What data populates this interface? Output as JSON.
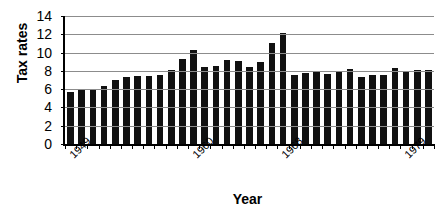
{
  "chart_data": {
    "type": "bar",
    "title": "",
    "xlabel": "Year",
    "ylabel": "Tax rates",
    "ylim": [
      0,
      14
    ],
    "ytick_step": 2,
    "yticks": [
      14,
      12,
      10,
      8,
      6,
      4,
      2,
      0
    ],
    "grid": true,
    "legend": false,
    "bar_color": "#111111",
    "gridline_color": "#8c8c8c",
    "axis_color": "#000000",
    "categories": [
      "1949",
      "1950",
      "1951",
      "1952",
      "1953",
      "1954",
      "1955",
      "1956",
      "1957",
      "1958",
      "1959",
      "1960",
      "1961",
      "1962",
      "1963",
      "1964",
      "1965",
      "1966",
      "1967",
      "1968",
      "1969",
      "1970",
      "1971",
      "1972",
      "1973",
      "1974",
      "1975",
      "1976",
      "1977",
      "1978",
      "1979",
      "1980",
      "1981"
    ],
    "values": [
      5.7,
      6.0,
      6.0,
      6.3,
      7.0,
      7.3,
      7.4,
      7.4,
      7.6,
      8.05,
      9.35,
      10.25,
      8.45,
      8.55,
      9.15,
      9.1,
      8.45,
      9.0,
      11.0,
      12.15,
      7.55,
      7.75,
      7.9,
      7.7,
      8.0,
      8.2,
      7.3,
      7.6,
      7.6,
      8.3,
      7.9,
      8.05,
      8.1
    ],
    "xtick_labels_shown": [
      {
        "label": "1949",
        "index": 0
      },
      {
        "label": "1960",
        "index": 11
      },
      {
        "label": "1968",
        "index": 19
      },
      {
        "label": "1979",
        "index": 30
      }
    ]
  }
}
